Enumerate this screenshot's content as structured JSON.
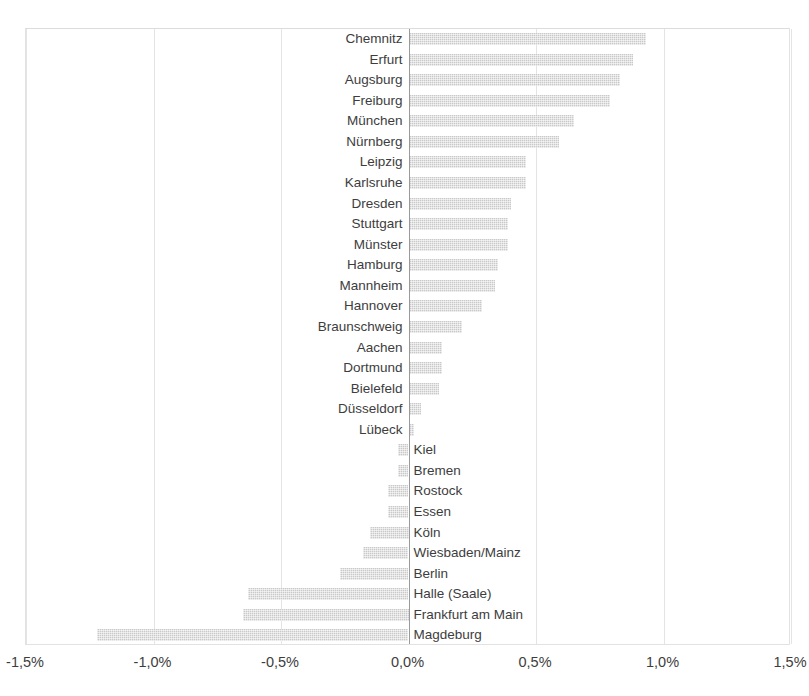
{
  "chart_data": {
    "type": "bar",
    "orientation": "horizontal",
    "title": "",
    "subtitle": "",
    "xlabel": "",
    "ylabel": "",
    "xlim": [
      -1.5,
      1.5
    ],
    "grid": true,
    "legend": null,
    "value_unit": "%",
    "decimal_separator": ",",
    "bar_color": "#c9c9c9",
    "axis_color": "#9a9a9a",
    "gridline_color": "#e4e4e4",
    "xticks": [
      -1.5,
      -1.0,
      -0.5,
      0.0,
      0.5,
      1.0,
      1.5
    ],
    "xtick_labels": [
      "-1,5%",
      "-1,0%",
      "-0,5%",
      "0,0%",
      "0,5%",
      "1,0%",
      "1,5%"
    ],
    "categories": [
      "Chemnitz",
      "Erfurt",
      "Augsburg",
      "Freiburg",
      "München",
      "Nürnberg",
      "Leipzig",
      "Karlsruhe",
      "Dresden",
      "Stuttgart",
      "Münster",
      "Hamburg",
      "Mannheim",
      "Hannover",
      "Braunschweig",
      "Aachen",
      "Dortmund",
      "Bielefeld",
      "Düsseldorf",
      "Lübeck",
      "Kiel",
      "Bremen",
      "Rostock",
      "Essen",
      "Köln",
      "Wiesbaden/Mainz",
      "Berlin",
      "Halle (Saale)",
      "Frankfurt am Main",
      "Magdeburg"
    ],
    "values": [
      0.93,
      0.88,
      0.83,
      0.79,
      0.65,
      0.59,
      0.46,
      0.46,
      0.4,
      0.39,
      0.39,
      0.35,
      0.34,
      0.29,
      0.21,
      0.13,
      0.13,
      0.12,
      0.05,
      0.02,
      -0.04,
      -0.04,
      -0.08,
      -0.08,
      -0.15,
      -0.18,
      -0.27,
      -0.63,
      -0.65,
      -1.22
    ]
  }
}
